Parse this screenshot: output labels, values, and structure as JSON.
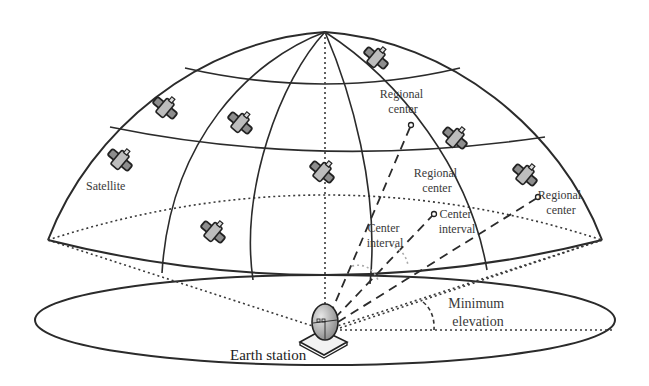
{
  "diagram": {
    "labels": {
      "satellite": "Satellite",
      "regional_center_1": [
        "Regional",
        "center"
      ],
      "regional_center_2": [
        "Regional",
        "center"
      ],
      "regional_center_3": [
        "Regional",
        "center"
      ],
      "center_interval_1": [
        "Center",
        "interval"
      ],
      "center_interval_2": [
        "Center",
        "interval"
      ],
      "minimum_elevation": [
        "Minimum",
        "elevation"
      ],
      "earth_station": "Earth station"
    },
    "satellites": [
      {
        "x": 376,
        "y": 58
      },
      {
        "x": 165,
        "y": 108
      },
      {
        "x": 240,
        "y": 123
      },
      {
        "x": 455,
        "y": 138
      },
      {
        "x": 120,
        "y": 160
      },
      {
        "x": 322,
        "y": 172
      },
      {
        "x": 525,
        "y": 175
      },
      {
        "x": 213,
        "y": 232
      }
    ],
    "colors": {
      "line": "#2b2b2b",
      "text": "#3a3a3a",
      "satellite_body": "#9a9a9a",
      "dish": "#b5b5b5"
    }
  }
}
